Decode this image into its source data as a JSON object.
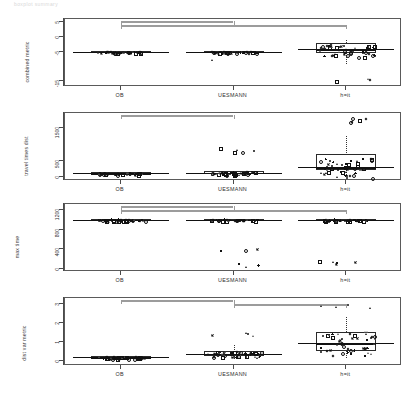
{
  "figure": {
    "title": "boxplot summary",
    "groups": [
      "OB",
      "UESMANN",
      "h=it"
    ],
    "group_centers_pct": [
      16.5,
      50,
      83.5
    ]
  },
  "chart_data": {
    "type": "box",
    "title": "boxplot summary",
    "categories": [
      "OB",
      "UESMANN",
      "h=it"
    ],
    "panels": [
      {
        "ylabel": "combined metric",
        "yticks": [
          5,
          0,
          -5,
          -15
        ],
        "ylim": [
          -17,
          6
        ],
        "brackets": [
          {
            "from": "OB",
            "to": "UESMANN",
            "level": 1
          },
          {
            "from": "OB",
            "to": "h=it",
            "level": 2
          }
        ],
        "boxes": [
          {
            "group": "OB",
            "min": -7.8,
            "q1": -5.3,
            "median": -5.0,
            "q3": -4.8,
            "max": -3.0,
            "outliers": []
          },
          {
            "group": "UESMANN",
            "min": -8.2,
            "q1": -5.4,
            "median": -5.0,
            "q3": -4.7,
            "max": -2.6,
            "outliers": [
              -7.4
            ]
          },
          {
            "group": "h=it",
            "min": -9.4,
            "q1": -5.6,
            "median": -4.3,
            "q3": -2.2,
            "max": -1.0,
            "outliers": [
              -14.6,
              -14.2,
              -14.0
            ]
          }
        ]
      },
      {
        "ylabel": "travel times dist",
        "yticks": [
          1500,
          500,
          0
        ],
        "ylim": [
          -120,
          1950
        ],
        "brackets": [
          {
            "from": "OB",
            "to": "UESMANN",
            "level": 1
          }
        ],
        "boxes": [
          {
            "group": "OB",
            "min": 20,
            "q1": 95,
            "median": 120,
            "q3": 150,
            "max": 260,
            "outliers": []
          },
          {
            "group": "UESMANN",
            "min": 20,
            "q1": 100,
            "median": 135,
            "q3": 175,
            "max": 300,
            "outliers": [
              780,
              800,
              830,
              860,
              900
            ]
          },
          {
            "group": "h=it",
            "min": 60,
            "q1": 230,
            "median": 300,
            "q3": 700,
            "max": 1250,
            "outliers": [
              1700,
              1720,
              1760,
              1800,
              1830
            ]
          }
        ]
      },
      {
        "ylabel": "max time",
        "yticks": [
          1200,
          800,
          400,
          0
        ],
        "ylim": [
          -60,
          1320
        ],
        "brackets": [
          {
            "from": "OB",
            "to": "UESMANN",
            "level": 1
          },
          {
            "from": "OB",
            "to": "h=it",
            "level": 2
          }
        ],
        "boxes": [
          {
            "group": "OB",
            "min": 880,
            "q1": 995,
            "median": 1005,
            "q3": 1015,
            "max": 1100,
            "outliers": []
          },
          {
            "group": "UESMANN",
            "min": 870,
            "q1": 995,
            "median": 1005,
            "q3": 1015,
            "max": 1105,
            "outliers": [
              380,
              400,
              430,
              60,
              90,
              120
            ]
          },
          {
            "group": "h=it",
            "min": 880,
            "q1": 995,
            "median": 1005,
            "q3": 1015,
            "max": 1110,
            "outliers": [
              150,
              140,
              170,
              110,
              190
            ]
          }
        ]
      },
      {
        "ylabel": "dist var metric",
        "yticks": [
          3.0,
          2.0,
          1.0,
          0.0
        ],
        "ylim": [
          -0.25,
          3.3
        ],
        "brackets": [
          {
            "from": "OB",
            "to": "UESMANN",
            "level": 1
          },
          {
            "from": "UESMANN",
            "to": "h=it",
            "level": 2
          }
        ],
        "boxes": [
          {
            "group": "OB",
            "min": 0.02,
            "q1": 0.17,
            "median": 0.22,
            "q3": 0.28,
            "max": 0.45,
            "outliers": []
          },
          {
            "group": "UESMANN",
            "min": 0.05,
            "q1": 0.28,
            "median": 0.4,
            "q3": 0.55,
            "max": 0.85,
            "outliers": [
              1.35,
              1.4,
              1.45,
              1.5
            ]
          },
          {
            "group": "h=it",
            "min": 0.1,
            "q1": 0.55,
            "median": 0.95,
            "q3": 1.55,
            "max": 2.3,
            "outliers": [
              2.85,
              2.9,
              2.95,
              3.0
            ]
          }
        ]
      }
    ]
  }
}
